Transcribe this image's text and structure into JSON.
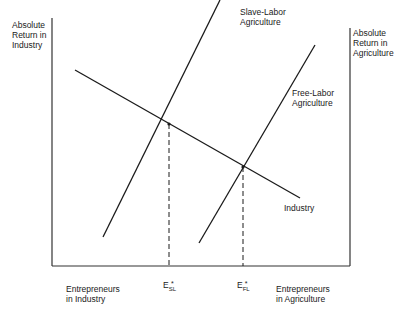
{
  "diagram": {
    "left_axis_label": "Absolute\nReturn in\nIndustry",
    "right_axis_label": "Absolute\nReturn in\nAgriculture",
    "bottom_left_label": "Entrepreneurs\nin Industry",
    "bottom_right_label": "Entrepreneurs\nin Agriculture",
    "curves": [
      {
        "name": "Slave-Labor Agriculture",
        "label": "Slave-Labor\nAgriculture",
        "slope": "upward"
      },
      {
        "name": "Free-Labor Agriculture",
        "label": "Free-Labor\nAgriculture",
        "slope": "upward"
      },
      {
        "name": "Industry",
        "label": "Industry",
        "slope": "downward"
      }
    ],
    "equilibria": [
      {
        "symbol": "E",
        "superscript": "*",
        "subscript": "SL",
        "description": "Slave-Labor equilibrium"
      },
      {
        "symbol": "E",
        "superscript": "*",
        "subscript": "FL",
        "description": "Free-Labor equilibrium"
      }
    ]
  },
  "colors": {
    "line": "#1a1a1a",
    "axis": "#333333",
    "background": "#ffffff"
  }
}
